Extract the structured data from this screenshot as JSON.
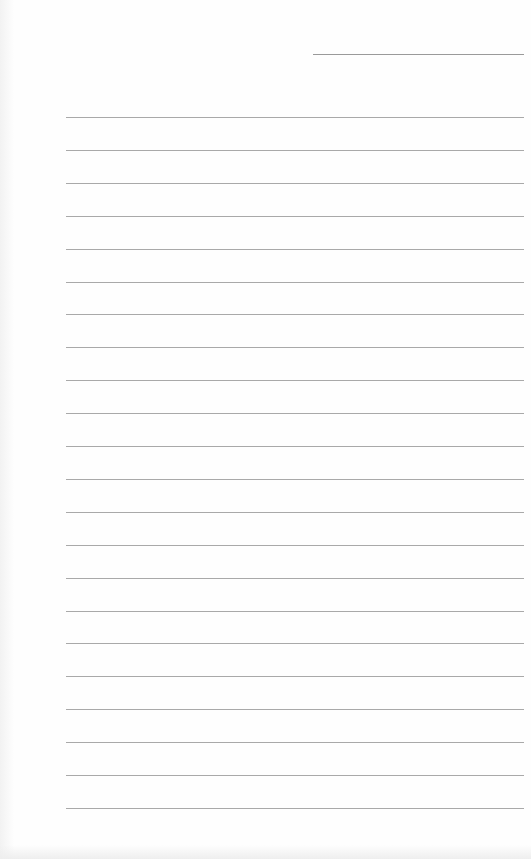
{
  "page": {
    "type": "blank lined writing paper",
    "background_color": "#fefefe",
    "line_color": "#a9a9a9"
  },
  "date_line": {
    "x": 313,
    "y": 54,
    "width": 211,
    "text": ""
  },
  "ruled_lines": {
    "count": 22,
    "first_y": 117,
    "spacing": 32.9,
    "x": 66,
    "width": 458,
    "text": [
      "",
      "",
      "",
      "",
      "",
      "",
      "",
      "",
      "",
      "",
      "",
      "",
      "",
      "",
      "",
      "",
      "",
      "",
      "",
      "",
      "",
      ""
    ]
  }
}
